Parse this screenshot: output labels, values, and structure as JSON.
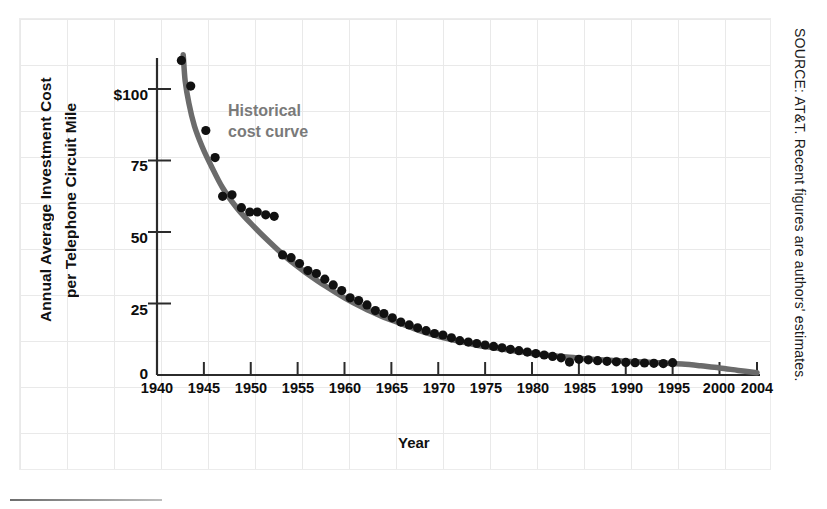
{
  "chart_data": {
    "type": "scatter",
    "title": "",
    "xlabel": "Year",
    "ylabel": "Annual Average Investment Cost per Telephone Circuit Mile",
    "ylabel_line1": "Annual Average Investment Cost",
    "ylabel_line2": "per Telephone Circuit Mile",
    "xlim": [
      1940,
      2004
    ],
    "ylim": [
      0,
      110
    ],
    "xticks": [
      1940,
      1945,
      1950,
      1955,
      1960,
      1965,
      1970,
      1975,
      1980,
      1985,
      1990,
      1995,
      2000,
      2004
    ],
    "xtick_labels": [
      "1940",
      "1945",
      "1950",
      "1955",
      "1960",
      "1965",
      "1970",
      "1975",
      "1980",
      "1985",
      "1990",
      "1995",
      "2000",
      "2004"
    ],
    "yticks": [
      0,
      25,
      50,
      75,
      100
    ],
    "ytick_labels": [
      "0",
      "25",
      "50",
      "75",
      "$100"
    ],
    "grid": "faint graph-paper background",
    "legend": "none",
    "annotations": [
      {
        "text": "Historical\ncost curve",
        "x": 1953,
        "y": 85,
        "color": "#7a7a7a"
      }
    ],
    "series": [
      {
        "name": "Observed annual average investment cost",
        "marker": "filled-circle",
        "color": "#111111",
        "points": [
          [
            1942.6,
            110.0
          ],
          [
            1943.6,
            101.0
          ],
          [
            1945.2,
            85.5
          ],
          [
            1946.2,
            76.0
          ],
          [
            1947.0,
            62.5
          ],
          [
            1948.0,
            63.0
          ],
          [
            1949.0,
            58.5
          ],
          [
            1949.9,
            57.0
          ],
          [
            1950.7,
            57.0
          ],
          [
            1951.6,
            56.0
          ],
          [
            1952.5,
            55.5
          ],
          [
            1953.4,
            42.0
          ],
          [
            1954.3,
            41.0
          ],
          [
            1955.2,
            39.0
          ],
          [
            1956.1,
            36.5
          ],
          [
            1957.0,
            35.5
          ],
          [
            1957.9,
            33.5
          ],
          [
            1958.8,
            31.5
          ],
          [
            1959.7,
            29.5
          ],
          [
            1960.6,
            27.0
          ],
          [
            1961.5,
            26.0
          ],
          [
            1962.4,
            24.5
          ],
          [
            1963.3,
            22.5
          ],
          [
            1964.2,
            21.5
          ],
          [
            1965.1,
            20.0
          ],
          [
            1966.0,
            18.5
          ],
          [
            1966.9,
            17.5
          ],
          [
            1967.8,
            16.5
          ],
          [
            1968.7,
            15.5
          ],
          [
            1969.6,
            14.5
          ],
          [
            1970.5,
            14.0
          ],
          [
            1971.4,
            13.0
          ],
          [
            1972.3,
            12.0
          ],
          [
            1973.2,
            11.5
          ],
          [
            1974.1,
            11.0
          ],
          [
            1975.0,
            10.5
          ],
          [
            1975.9,
            10.0
          ],
          [
            1976.8,
            9.5
          ],
          [
            1977.7,
            9.0
          ],
          [
            1978.6,
            8.5
          ],
          [
            1979.5,
            8.0
          ],
          [
            1980.4,
            7.5
          ],
          [
            1981.3,
            7.0
          ],
          [
            1982.2,
            6.5
          ],
          [
            1983.1,
            6.0
          ],
          [
            1984.0,
            4.5
          ],
          [
            1985.0,
            5.5
          ],
          [
            1986.0,
            5.3
          ],
          [
            1987.0,
            5.0
          ],
          [
            1988.0,
            4.8
          ],
          [
            1989.0,
            4.6
          ],
          [
            1990.0,
            4.4
          ],
          [
            1991.0,
            4.3
          ],
          [
            1992.0,
            4.2
          ],
          [
            1993.0,
            4.1
          ],
          [
            1994.0,
            4.0
          ],
          [
            1995.0,
            4.3
          ]
        ]
      },
      {
        "name": "Historical cost curve (fitted)",
        "marker": "none",
        "style": "thick-gray-line",
        "color": "#6b6b6b",
        "points": [
          [
            1942.8,
            112.0
          ],
          [
            1943.0,
            103.0
          ],
          [
            1943.4,
            95.0
          ],
          [
            1944.0,
            87.0
          ],
          [
            1944.8,
            80.0
          ],
          [
            1945.8,
            73.0
          ],
          [
            1947.0,
            65.5
          ],
          [
            1948.5,
            58.5
          ],
          [
            1950.0,
            53.0
          ],
          [
            1952.0,
            46.5
          ],
          [
            1954.0,
            40.5
          ],
          [
            1956.0,
            35.5
          ],
          [
            1958.0,
            31.0
          ],
          [
            1960.0,
            27.0
          ],
          [
            1962.0,
            23.5
          ],
          [
            1964.0,
            20.5
          ],
          [
            1966.0,
            18.0
          ],
          [
            1968.0,
            15.5
          ],
          [
            1970.0,
            13.5
          ],
          [
            1972.0,
            12.0
          ],
          [
            1974.0,
            10.5
          ],
          [
            1976.0,
            9.5
          ],
          [
            1978.0,
            8.5
          ],
          [
            1980.0,
            7.5
          ],
          [
            1982.0,
            6.8
          ],
          [
            1984.0,
            6.2
          ],
          [
            1986.0,
            5.6
          ],
          [
            1988.0,
            5.2
          ],
          [
            1990.0,
            4.8
          ],
          [
            1992.0,
            4.5
          ],
          [
            1994.0,
            4.2
          ],
          [
            1996.0,
            3.8
          ],
          [
            1998.0,
            3.2
          ],
          [
            2000.0,
            2.5
          ],
          [
            2002.0,
            1.6
          ],
          [
            2004.0,
            0.8
          ]
        ]
      }
    ]
  },
  "source": {
    "note": "SOURCE: AT&T. Recent figures are authors' estimates."
  },
  "colors": {
    "marker": "#111111",
    "curve": "#6b6b6b",
    "annotation": "#7a7a7a",
    "axis": "#2b2b2b",
    "grid": "#e9e9e9"
  }
}
